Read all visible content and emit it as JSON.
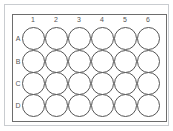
{
  "plate": {
    "type": "24-well plate",
    "columns": [
      "1",
      "2",
      "3",
      "4",
      "5",
      "6"
    ],
    "rows": [
      "A",
      "B",
      "C",
      "D"
    ],
    "colors": {
      "well_stroke": "#555555",
      "plate_border": "#6d6d6d",
      "outer_border": "#c9ccd0",
      "label": "#555555"
    }
  }
}
